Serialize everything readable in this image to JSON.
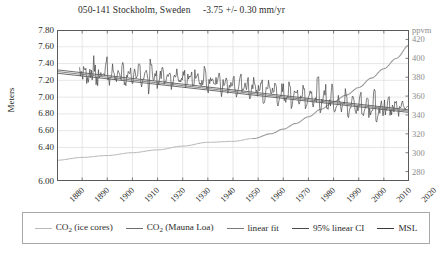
{
  "title": "050-141 Stockholm, Sweden     -3.75 +/- 0.30 mm/yr",
  "station": {
    "id": "050-141",
    "name": "Stockholm, Sweden",
    "trend": "-3.75 +/- 0.30 mm/yr"
  },
  "axes": {
    "y_left_label": "Meters",
    "y_right_label": "ppvm",
    "y_left_ticks": [
      "7.80",
      "7.60",
      "7.40",
      "7.20",
      "7.00",
      "6.80",
      "6.60",
      "6.40",
      "6.00"
    ],
    "y_right_ticks": [
      "420",
      "400",
      "380",
      "360",
      "340",
      "320",
      "300",
      "280"
    ],
    "x_ticks": [
      "1880",
      "1890",
      "1900",
      "1910",
      "1920",
      "1930",
      "1940",
      "1950",
      "1960",
      "1970",
      "1980",
      "1990",
      "2000",
      "2010",
      "2020"
    ]
  },
  "legend": {
    "items": [
      {
        "label_html": "CO<sub>2</sub> (ice cores)",
        "label": "CO2 (ice cores)",
        "color": "#b9b9b9",
        "width": 1
      },
      {
        "label_html": "CO<sub>2</sub> (Mauna Loa)",
        "label": "CO2 (Mauna Loa)",
        "color": "#6e6e6e",
        "width": 1.3
      },
      {
        "label_html": "linear fit",
        "label": "linear fit",
        "color": "#7a7a7a",
        "width": 1.4
      },
      {
        "label_html": "95% linear CI",
        "label": "95% linear CI",
        "color": "#4a4a4a",
        "width": 1.8
      },
      {
        "label_html": "MSL",
        "label": "MSL",
        "color": "#3a3a3a",
        "width": 1.6
      }
    ]
  },
  "colors": {
    "frame": "#5a5a5a",
    "grid": "#dcdcdc",
    "msl": "#3c3c3c",
    "fit": "#7a7a7a",
    "ci": "#5c5c5c",
    "co2_ice": "#b5b5b5",
    "co2_mlo": "#9a9a9a",
    "text": "#2b2b2b",
    "right_axis_text": "#8d8d8d"
  },
  "chart_data": {
    "type": "line",
    "title": "050-141 Stockholm, Sweden     -3.75 +/- 0.30 mm/yr",
    "xlabel": "",
    "ylabel": "Meters",
    "y2label": "ppvm",
    "xlim": [
      1880,
      2020
    ],
    "ylim": [
      6.0,
      7.8
    ],
    "y2lim": [
      270,
      430
    ],
    "grid": true,
    "legend_position": "below",
    "y_left_tick_values": [
      7.8,
      7.6,
      7.4,
      7.2,
      7.0,
      6.8,
      6.6,
      6.4,
      6.0
    ],
    "y_right_tick_values": [
      420,
      400,
      380,
      360,
      340,
      320,
      300,
      280
    ],
    "x_tick_values": [
      1880,
      1890,
      1900,
      1910,
      1920,
      1930,
      1940,
      1950,
      1960,
      1970,
      1980,
      1990,
      2000,
      2010,
      2020
    ],
    "annotations": [
      {
        "text": "-3.75 +/- 0.30 mm/yr",
        "meaning": "relative mean sea level trend with 95% confidence interval"
      }
    ],
    "series": [
      {
        "name": "linear fit",
        "axis": "left",
        "type": "line",
        "color": "#7a7a7a",
        "x": [
          1880,
          2020
        ],
        "values": [
          7.305,
          6.8325
        ],
        "note": "straight line, slope -3.75 mm/yr over 140 yr = -0.525 m"
      },
      {
        "name": "95% linear CI upper",
        "axis": "left",
        "type": "line",
        "color": "#5c5c5c",
        "x": [
          1880,
          2020
        ],
        "values": [
          7.325,
          6.8475
        ]
      },
      {
        "name": "95% linear CI lower",
        "axis": "left",
        "type": "line",
        "color": "#5c5c5c",
        "x": [
          1880,
          2020
        ],
        "values": [
          7.285,
          6.8175
        ]
      },
      {
        "name": "CO2 (ice cores)",
        "axis": "right",
        "type": "line",
        "color": "#b5b5b5",
        "x": [
          1880,
          1890,
          1900,
          1910,
          1920,
          1930,
          1940,
          1950,
          1958
        ],
        "values": [
          292,
          295,
          297,
          300,
          303,
          307,
          311,
          312,
          315
        ]
      },
      {
        "name": "CO2 (Mauna Loa)",
        "axis": "right",
        "type": "line",
        "color": "#9a9a9a",
        "x": [
          1958,
          1965,
          1970,
          1975,
          1980,
          1985,
          1990,
          1995,
          2000,
          2005,
          2010,
          2015,
          2020
        ],
        "values": [
          315,
          320,
          325,
          331,
          338,
          346,
          354,
          361,
          369,
          379,
          389,
          400,
          414
        ]
      },
      {
        "name": "MSL",
        "axis": "left",
        "type": "line",
        "color": "#3c3c3c",
        "x_start": 1889,
        "x_end": 2019,
        "note": "monthly/annual relative mean sea level, high-frequency noise around declining trend",
        "values": [
          7.3,
          7.26,
          7.33,
          7.21,
          7.29,
          7.25,
          7.35,
          7.19,
          7.28,
          7.31,
          7.22,
          7.37,
          7.18,
          7.27,
          7.34,
          7.2,
          7.3,
          7.24,
          7.39,
          7.16,
          7.27,
          7.32,
          7.19,
          7.28,
          7.23,
          7.36,
          7.14,
          7.26,
          7.31,
          7.18,
          7.41,
          7.22,
          7.29,
          7.15,
          7.27,
          7.33,
          7.17,
          7.25,
          7.3,
          7.12,
          7.24,
          7.28,
          7.16,
          7.22,
          7.31,
          7.13,
          7.23,
          7.27,
          7.1,
          7.21,
          7.26,
          7.14,
          7.2,
          7.29,
          7.08,
          7.19,
          7.24,
          7.12,
          7.18,
          7.26,
          7.05,
          7.17,
          7.22,
          7.09,
          7.15,
          7.24,
          7.03,
          7.14,
          7.2,
          7.07,
          7.13,
          7.21,
          7.0,
          7.11,
          7.18,
          7.05,
          7.1,
          7.19,
          6.97,
          7.08,
          7.15,
          7.02,
          7.07,
          7.16,
          6.94,
          7.05,
          7.12,
          6.99,
          7.04,
          7.13,
          6.91,
          7.02,
          7.09,
          6.96,
          7.01,
          7.1,
          6.88,
          6.99,
          7.06,
          6.93,
          6.98,
          7.2,
          6.85,
          6.96,
          7.03,
          6.9,
          6.95,
          7.12,
          6.82,
          6.93,
          7.0,
          6.87,
          6.92,
          7.05,
          6.79,
          6.9,
          6.97,
          6.84,
          6.89,
          7.02,
          6.76,
          6.87,
          6.94,
          6.81,
          6.86,
          7.08,
          6.73,
          6.84,
          6.91,
          6.78,
          6.83,
          6.98,
          6.8,
          6.86,
          6.93,
          6.82,
          6.88,
          6.95,
          6.84,
          6.9
        ]
      }
    ]
  }
}
